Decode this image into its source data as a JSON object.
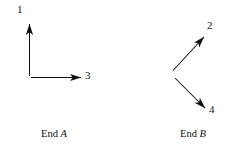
{
  "figure": {
    "background_color": "#ffffff",
    "stroke_color": "#111111",
    "width": 229,
    "height": 149,
    "groups": [
      {
        "id": "end-a",
        "caption_prefix": "End",
        "caption_letter": "A",
        "caption_full": "End A",
        "arrows": [
          {
            "id": "arrow-1",
            "label": "1",
            "direction": "up",
            "x1": 29.5,
            "y1": 76,
            "x2": 29.5,
            "y2": 23
          },
          {
            "id": "arrow-3",
            "label": "3",
            "direction": "right",
            "x1": 31,
            "y1": 77.5,
            "x2": 82,
            "y2": 77.5
          }
        ]
      },
      {
        "id": "end-b",
        "caption_prefix": "End",
        "caption_letter": "B",
        "caption_full": "End B",
        "arrows": [
          {
            "id": "arrow-2",
            "label": "2",
            "direction": "up-right",
            "x1": 173,
            "y1": 70,
            "x2": 205,
            "y2": 36
          },
          {
            "id": "arrow-4",
            "label": "4",
            "direction": "down-right",
            "x1": 175,
            "y1": 78,
            "x2": 206,
            "y2": 109
          }
        ]
      }
    ]
  },
  "labels": {
    "one": "1",
    "two": "2",
    "three": "3",
    "four": "4"
  },
  "captions": {
    "end_a_prefix": "End ",
    "end_a_letter": "A",
    "end_b_prefix": "End ",
    "end_b_letter": "B"
  }
}
